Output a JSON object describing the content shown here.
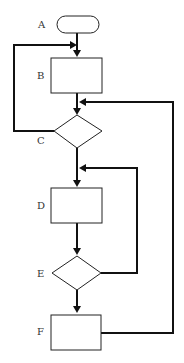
{
  "diagram": {
    "type": "flowchart",
    "colors": {
      "stroke": "#222222",
      "edge": "#111111",
      "label": "#333333",
      "background": "#ffffff"
    },
    "nodes": [
      {
        "id": "A",
        "label": "A",
        "shape": "terminator"
      },
      {
        "id": "B",
        "label": "B",
        "shape": "process"
      },
      {
        "id": "C",
        "label": "C",
        "shape": "decision"
      },
      {
        "id": "D",
        "label": "D",
        "shape": "process"
      },
      {
        "id": "E",
        "label": "E",
        "shape": "decision"
      },
      {
        "id": "F",
        "label": "F",
        "shape": "process"
      }
    ],
    "edges": [
      {
        "from": "A",
        "to": "B"
      },
      {
        "from": "B",
        "to": "C"
      },
      {
        "from": "C",
        "to": "B",
        "type": "loop-back"
      },
      {
        "from": "C",
        "to": "D"
      },
      {
        "from": "D",
        "to": "E"
      },
      {
        "from": "E",
        "to": "D",
        "type": "loop-back"
      },
      {
        "from": "E",
        "to": "F"
      },
      {
        "from": "F",
        "to": "C",
        "type": "loop-back"
      }
    ]
  }
}
